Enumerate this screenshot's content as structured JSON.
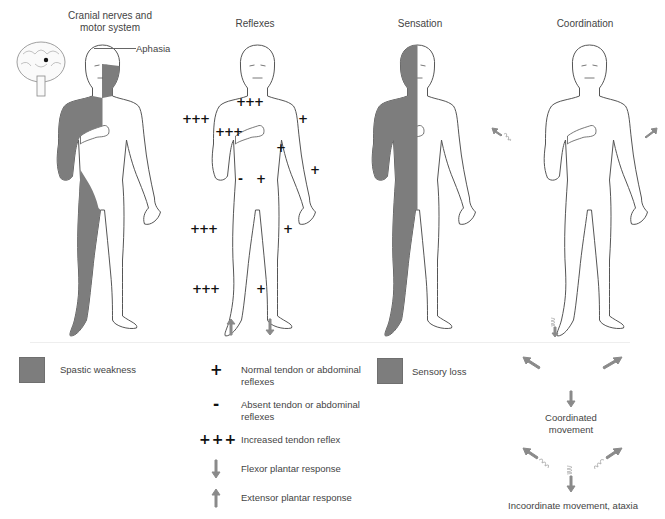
{
  "panels": {
    "cranial": {
      "title_line1": "Cranial nerves and",
      "title_line2": "motor system",
      "callout": "Aphasia"
    },
    "reflexes": {
      "title": "Reflexes",
      "marks": [
        {
          "text": "+++",
          "x": 236,
          "y": 96
        },
        {
          "text": "+++",
          "x": 182,
          "y": 113
        },
        {
          "text": "+++",
          "x": 215,
          "y": 126
        },
        {
          "text": "+",
          "x": 298,
          "y": 113
        },
        {
          "text": "+",
          "x": 276,
          "y": 142
        },
        {
          "text": "+",
          "x": 310,
          "y": 164
        },
        {
          "text": "-",
          "x": 238,
          "y": 173
        },
        {
          "text": "+",
          "x": 256,
          "y": 173
        },
        {
          "text": "+++",
          "x": 190,
          "y": 223
        },
        {
          "text": "+",
          "x": 283,
          "y": 223
        },
        {
          "text": "+++",
          "x": 192,
          "y": 283
        },
        {
          "text": "+",
          "x": 256,
          "y": 283
        }
      ]
    },
    "sensation": {
      "title": "Sensation"
    },
    "coordination": {
      "title": "Coordination"
    }
  },
  "legend": {
    "spastic_weakness": "Spastic weakness",
    "normal_reflex_symbol": "+",
    "normal_reflex": "Normal tendon or abdominal reflexes",
    "absent_reflex_symbol": "-",
    "absent_reflex": "Absent tendon or abdominal reflexes",
    "increased_reflex_symbol": "+++",
    "increased_reflex": "Increased tendon reflex",
    "flexor_plantar": "Flexor plantar response",
    "extensor_plantar": "Extensor plantar response",
    "sensory_loss": "Sensory loss",
    "coordinated": "Coordinated movement",
    "incoordinate": "Incoordinate movement, ataxia"
  },
  "colors": {
    "affected": "#7d7d7d",
    "outline": "#555555",
    "arrow": "#8a8a8a"
  }
}
